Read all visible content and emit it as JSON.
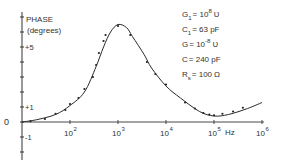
{
  "chart_data": {
    "type": "line",
    "title": "",
    "ylabel": "PHASE",
    "ylabel_unit": "(degrees)",
    "xlabel": "Hz",
    "x_scale": "log",
    "xlim": [
      10,
      1000000
    ],
    "ylim": [
      -2.5,
      7.5
    ],
    "x_ticks": [
      {
        "value": 100,
        "base": "10",
        "exp": "2"
      },
      {
        "value": 1000,
        "base": "10",
        "exp": "3"
      },
      {
        "value": 10000,
        "base": "10",
        "exp": "4"
      },
      {
        "value": 100000,
        "base": "10",
        "exp": "5"
      },
      {
        "value": 1000000,
        "base": "10",
        "exp": "6"
      }
    ],
    "y_tick_labels": [
      {
        "value": 5,
        "label": "+5"
      },
      {
        "value": 1,
        "label": "+1"
      },
      {
        "value": 0,
        "label": "0"
      },
      {
        "value": -1,
        "label": "-1"
      }
    ],
    "grid": false,
    "legend": null,
    "series": [
      {
        "name": "theory (solid curve)",
        "style": "line",
        "x": [
          10,
          20,
          50,
          100,
          200,
          350,
          500,
          700,
          1000,
          1500,
          2000,
          3500,
          5000,
          10000,
          20000,
          50000,
          100000,
          200000,
          500000,
          1000000
        ],
        "y": [
          0.0,
          0.15,
          0.5,
          1.1,
          2.0,
          3.7,
          5.0,
          6.0,
          6.5,
          6.3,
          5.7,
          4.5,
          3.6,
          2.4,
          1.6,
          0.7,
          0.4,
          0.5,
          0.9,
          1.3
        ]
      },
      {
        "name": "measured (dots)",
        "style": "points",
        "x": [
          15,
          30,
          50,
          80,
          100,
          150,
          200,
          300,
          350,
          400,
          500,
          550,
          1000,
          1800,
          4000,
          6000,
          10000,
          25000,
          40000,
          60000,
          80000,
          100000,
          150000,
          250000,
          400000
        ],
        "y": [
          0.05,
          0.2,
          0.55,
          0.8,
          1.2,
          1.6,
          2.2,
          3.0,
          3.8,
          4.6,
          5.4,
          5.8,
          6.4,
          5.8,
          4.0,
          3.2,
          2.5,
          1.3,
          0.9,
          0.6,
          0.5,
          0.45,
          0.55,
          0.7,
          0.95
        ]
      }
    ],
    "annotations": [
      {
        "name": "G1",
        "sym": "G",
        "sub": "1",
        "eq": "=",
        "val": "10",
        "sup": "8",
        "unit": "Ʋ"
      },
      {
        "name": "C1",
        "sym": "C",
        "sub": "1",
        "eq": "=",
        "val": "63 pF",
        "sup": "",
        "unit": ""
      },
      {
        "name": "G",
        "sym": "G",
        "sub": "",
        "eq": "=",
        "val": "10",
        "sup": "-8",
        "unit": "Ʋ"
      },
      {
        "name": "C",
        "sym": "C",
        "sub": "",
        "eq": "=",
        "val": "240 pF",
        "sup": "",
        "unit": ""
      },
      {
        "name": "Rs",
        "sym": "R",
        "sub": "s",
        "eq": "=",
        "val": "100",
        "sup": "",
        "unit": "Ω"
      }
    ],
    "colors": {
      "ink": "#2a2a2a",
      "background": "#ffffff"
    }
  }
}
